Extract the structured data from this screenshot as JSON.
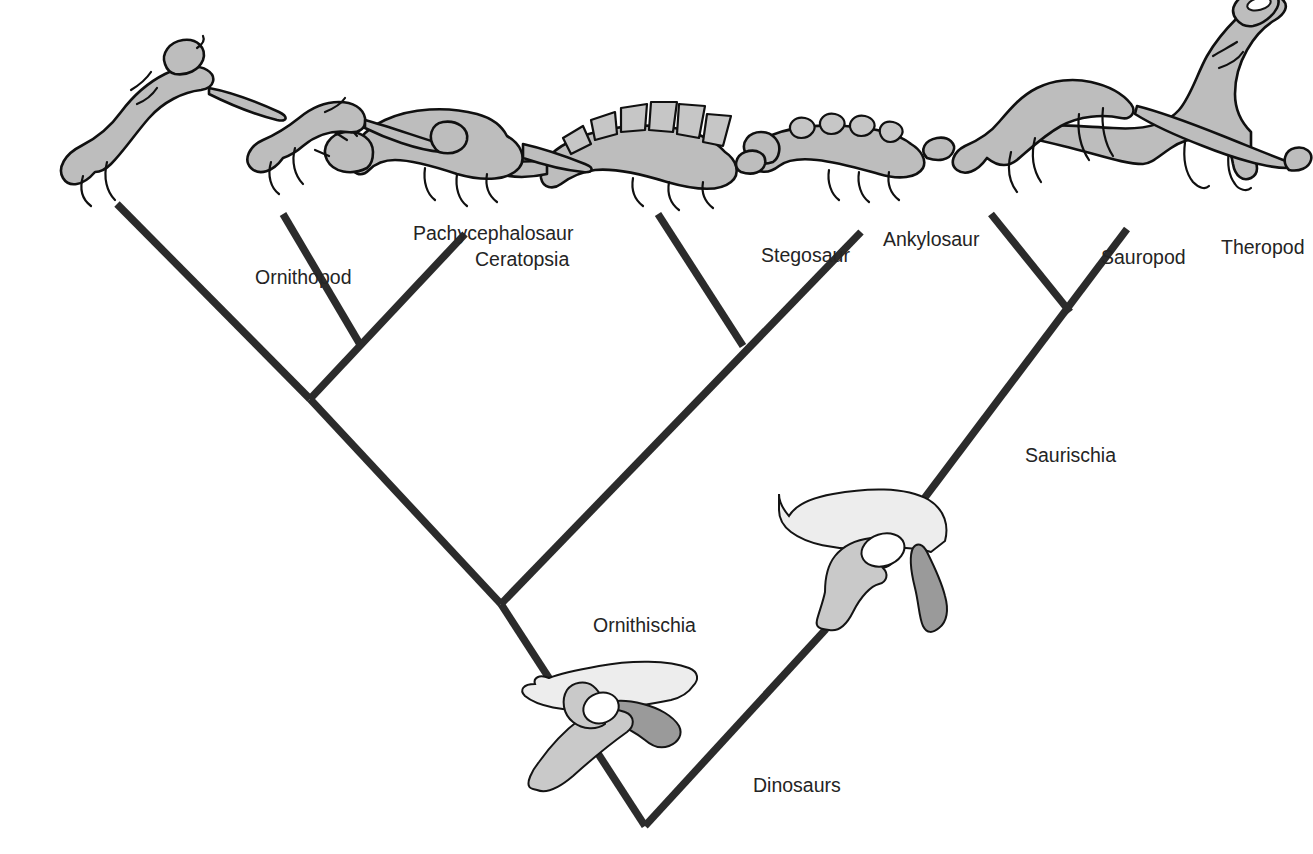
{
  "figure": {
    "type": "cladogram",
    "orientation": "rotated-180",
    "caption_partial": "Dinosaur classification cladogram — page caption cropped at image edge",
    "background_color": "#ffffff",
    "branch_color": "#2b2b2b",
    "label_color": "#242424"
  },
  "tree": {
    "root": {
      "label": "Dinosaurs"
    },
    "nodes": [
      {
        "id": "dinosaurs",
        "label": "Dinosaurs",
        "level": 0,
        "x": 668,
        "y": 28,
        "label_x": 560,
        "label_y": 62
      },
      {
        "id": "saurischia",
        "label": "Saurischia",
        "level": 1,
        "x": 487,
        "y": 225,
        "label_x": 288,
        "label_y": 392
      },
      {
        "id": "ornithischia",
        "label": "Ornithischia",
        "level": 1,
        "x": 812,
        "y": 250,
        "label_x": 720,
        "label_y": 222
      },
      {
        "id": "ornith-split",
        "label": "",
        "level": 2,
        "x": 1003,
        "y": 455
      }
    ],
    "tips": [
      {
        "id": "theropod",
        "label": "Theropod",
        "x": 186,
        "y": 625,
        "label_x": 92,
        "label_y": 600,
        "silhouette": "theropod-silhouette"
      },
      {
        "id": "sauropod",
        "label": "Sauropod",
        "x": 300,
        "y": 625,
        "label_x": 212,
        "label_y": 590,
        "silhouette": "sauropod-silhouette"
      },
      {
        "id": "ankylosaur",
        "label": "Ankylosaur",
        "x": 452,
        "y": 622,
        "label_x": 430,
        "label_y": 608,
        "silhouette": "ankylosaur-silhouette"
      },
      {
        "id": "stegosaur",
        "label": "Stegosaur",
        "x": 648,
        "y": 622,
        "label_x": 552,
        "label_y": 592,
        "silhouette": "stegosaur-silhouette"
      },
      {
        "id": "ceratopsia",
        "label": "Ceratopsia",
        "x": 842,
        "y": 615,
        "label_x": 838,
        "label_y": 588,
        "silhouette": "ceratopsian-silhouette"
      },
      {
        "id": "pachycephalosaur",
        "label": "Pachycephalosaur",
        "x": 1022,
        "y": 632,
        "label_x": 900,
        "label_y": 614,
        "silhouette": "pachycephalosaur-silhouette"
      },
      {
        "id": "ornithopod",
        "label": "Ornithopod",
        "x": 1192,
        "y": 632,
        "label_x": 1058,
        "label_y": 570,
        "silhouette": "ornithopod-silhouette"
      }
    ],
    "edges": [
      {
        "from": "dinosaurs",
        "to": "saurischia"
      },
      {
        "from": "dinosaurs",
        "to": "ornithischia"
      },
      {
        "from": "saurischia",
        "to": "theropod"
      },
      {
        "from": "saurischia",
        "to": "sauropod"
      },
      {
        "from": "ornithischia",
        "to": "ankylosaur"
      },
      {
        "from": "ornithischia",
        "to": "stegosaur"
      },
      {
        "from": "ornithischia",
        "to": "ornith-split"
      },
      {
        "from": "ornith-split",
        "to": "ceratopsia"
      },
      {
        "from": "ornith-split",
        "to": "pachycephalosaur"
      },
      {
        "from": "ornith-split",
        "to": "ornithopod"
      }
    ]
  },
  "hip_diagrams": [
    {
      "id": "saurischian-hip",
      "for_node": "saurischia",
      "name": "lizard-hipped pelvis",
      "colors": {
        "ilium": "#ededed",
        "pubis": "#c9c9c9",
        "ischium": "#9a9a9a"
      }
    },
    {
      "id": "ornithischian-hip",
      "for_node": "ornithischia",
      "name": "bird-hipped pelvis",
      "colors": {
        "ilium": "#ededed",
        "pubis": "#c9c9c9",
        "ischium": "#9a9a9a"
      }
    }
  ],
  "labels": {
    "dinosaurs": "Dinosaurs",
    "saurischia": "Saurischia",
    "ornithischia": "Ornithischia",
    "theropod": "Theropod",
    "sauropod": "Sauropod",
    "ankylosaur": "Ankylosaur",
    "stegosaur": "Stegosaur",
    "ceratopsia": "Ceratopsia",
    "pachycephalosaur": "Pachycephalosaur",
    "ornithopod": "Ornithopod"
  }
}
